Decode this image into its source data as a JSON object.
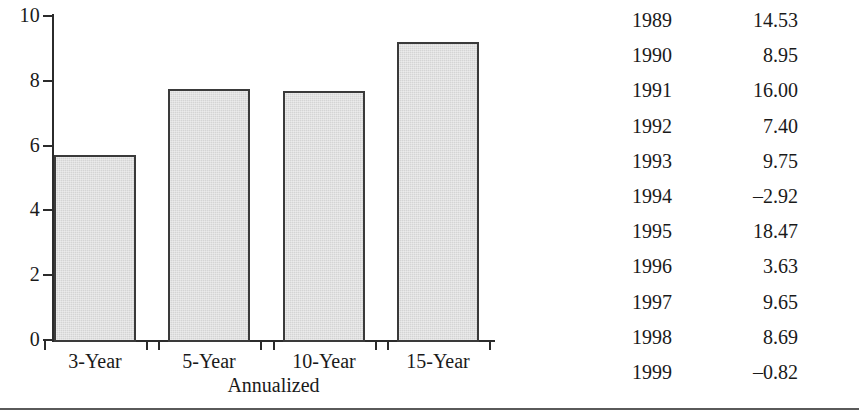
{
  "chart_data": {
    "type": "bar",
    "title": "",
    "xlabel": "Annualized",
    "ylabel": "",
    "categories": [
      "3-Year",
      "5-Year",
      "10-Year",
      "15-Year"
    ],
    "values": [
      5.7,
      7.75,
      7.7,
      9.2
    ],
    "ylim": [
      0,
      10
    ],
    "yticks": [
      0,
      2,
      4,
      6,
      8,
      10
    ],
    "ytick_labels": [
      "0",
      "2",
      "4",
      "6",
      "8",
      "10"
    ],
    "grid": false,
    "legend": "none",
    "bar_fill": "#d4d4d4",
    "bar_edge": "#3a3a3a"
  },
  "table": {
    "columns": [
      "",
      ""
    ],
    "rows": [
      {
        "year": "1989",
        "value": "14.53"
      },
      {
        "year": "1990",
        "value": "8.95"
      },
      {
        "year": "1991",
        "value": "16.00"
      },
      {
        "year": "1992",
        "value": "7.40"
      },
      {
        "year": "1993",
        "value": "9.75"
      },
      {
        "year": "1994",
        "value": "–2.92"
      },
      {
        "year": "1995",
        "value": "18.47"
      },
      {
        "year": "1996",
        "value": "3.63"
      },
      {
        "year": "1997",
        "value": "9.65"
      },
      {
        "year": "1998",
        "value": "8.69"
      },
      {
        "year": "1999",
        "value": "–0.82"
      }
    ]
  }
}
